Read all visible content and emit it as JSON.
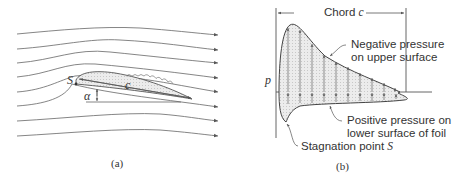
{
  "panel_a": {
    "caption": "(a)",
    "labels": {
      "stagnation": "S",
      "chord": "c",
      "angle": "α"
    }
  },
  "panel_b": {
    "caption": "(b)",
    "axis_label": "p",
    "chord_label": "Chord",
    "chord_symbol": "c",
    "upper_label_line1": "Negative pressure",
    "upper_label_line2": "on upper surface",
    "lower_label_line1": "Positive pressure on",
    "lower_label_line2": "lower surface of foil",
    "stagnation_label": "Stagnation point",
    "stagnation_symbol": "S"
  },
  "colors": {
    "line": "#555555",
    "fill": "#e6e6e6",
    "text": "#333333"
  }
}
